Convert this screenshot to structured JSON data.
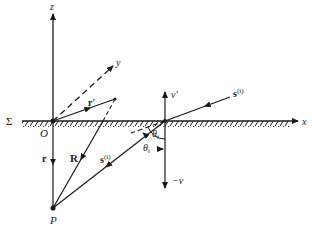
{
  "diagram": {
    "labels": {
      "z_axis": "z",
      "y_axis": "y",
      "x_axis": "x",
      "surface": "Σ",
      "origin": "O",
      "point_p": "P",
      "r_prime": "r′",
      "r": "r",
      "R": "R",
      "s_i_top": "s",
      "s_i_top_sup": "(i)",
      "s_i_bottom": "s",
      "s_i_bottom_sup": "(i)",
      "v_prime": "v′",
      "minus_v": "−v",
      "theta_i": "θ",
      "theta_i_sub": "i",
      "theta_t": "θ",
      "theta_t_sub": "t"
    },
    "colors": {
      "stroke": "#1a1a1a",
      "background": "#ffffff"
    }
  }
}
